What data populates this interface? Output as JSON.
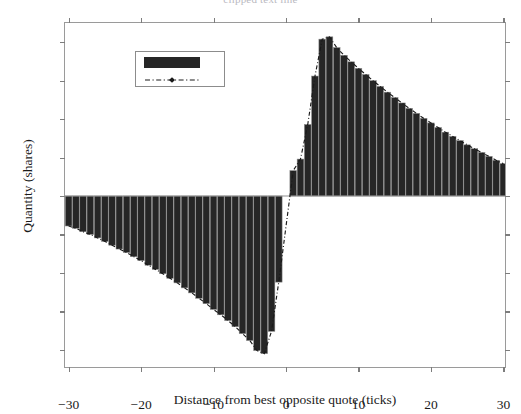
{
  "figure": {
    "caption_remnant": "clipped text line",
    "background": "#ffffff"
  },
  "chart_data": {
    "type": "bar",
    "title": "",
    "xlabel": "Distance from best opposite quote (ticks)",
    "ylabel": "Quantity (shares)",
    "xlim": [
      -30.5,
      30.5
    ],
    "ylim": [
      -2250,
      2250
    ],
    "xticks": [
      -30,
      -20,
      -10,
      0,
      10,
      20,
      30
    ],
    "xticklabels": [
      "-30",
      "-20",
      "-10",
      "0",
      "10",
      "20",
      "30"
    ],
    "yticks": [
      -2000,
      -1500,
      -1000,
      -500,
      0,
      500,
      1000,
      1500,
      2000
    ],
    "yticklabels": [
      "-2000",
      "-1500",
      "-1000",
      "-500",
      "0",
      "500",
      "1000",
      "1500",
      "2000"
    ],
    "grid": false,
    "legend": {
      "position": "upper left",
      "entries": [
        {
          "label": "",
          "type": "bar",
          "color": "#262626"
        },
        {
          "label": "",
          "type": "line",
          "color": "#1a1a1a",
          "linestyle": "dashdot",
          "marker": "diamond"
        }
      ]
    },
    "bar_color": "#262626",
    "bar_edge_color": "#8a8a8a",
    "line_color": "#1a1a1a",
    "categories": [
      -30,
      -29,
      -28,
      -27,
      -26,
      -25,
      -24,
      -23,
      -22,
      -21,
      -20,
      -19,
      -18,
      -17,
      -16,
      -15,
      -14,
      -13,
      -12,
      -11,
      -10,
      -9,
      -8,
      -7,
      -6,
      -5,
      -4,
      -3,
      -2,
      -1,
      1,
      2,
      3,
      4,
      5,
      6,
      7,
      8,
      9,
      10,
      11,
      12,
      13,
      14,
      15,
      16,
      17,
      18,
      19,
      20,
      21,
      22,
      23,
      24,
      25,
      26,
      27,
      28,
      29,
      30
    ],
    "series": [
      {
        "name": "quantity-bars",
        "type": "bar",
        "values": [
          -390,
          -420,
          -465,
          -500,
          -545,
          -590,
          -640,
          -690,
          -735,
          -790,
          -840,
          -900,
          -955,
          -1010,
          -1070,
          -1130,
          -1195,
          -1260,
          -1330,
          -1400,
          -1475,
          -1545,
          -1620,
          -1700,
          -1790,
          -1880,
          -2010,
          -2050,
          -1760,
          -1120,
          330,
          480,
          930,
          1560,
          2040,
          2070,
          1930,
          1830,
          1745,
          1660,
          1580,
          1500,
          1425,
          1350,
          1280,
          1210,
          1140,
          1075,
          1010,
          950,
          890,
          830,
          775,
          720,
          665,
          615,
          565,
          515,
          465,
          420
        ]
      },
      {
        "name": "quantity-line",
        "type": "line",
        "values": [
          -390,
          -420,
          -465,
          -500,
          -545,
          -590,
          -640,
          -690,
          -735,
          -790,
          -840,
          -900,
          -955,
          -1010,
          -1070,
          -1130,
          -1195,
          -1260,
          -1330,
          -1400,
          -1475,
          -1545,
          -1620,
          -1700,
          -1790,
          -1880,
          -2010,
          -2050,
          -1760,
          -1120,
          330,
          480,
          930,
          1560,
          2040,
          2070,
          1930,
          1830,
          1745,
          1660,
          1580,
          1500,
          1425,
          1350,
          1280,
          1210,
          1140,
          1075,
          1010,
          950,
          890,
          830,
          775,
          720,
          665,
          615,
          565,
          515,
          465,
          420
        ]
      }
    ]
  }
}
